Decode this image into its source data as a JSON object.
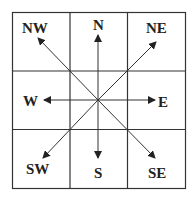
{
  "diagram": {
    "grid": {
      "rows": 3,
      "cols": 3
    },
    "center": "",
    "directions": [
      {
        "id": "nw",
        "label": "NW"
      },
      {
        "id": "n",
        "label": "N"
      },
      {
        "id": "ne",
        "label": "NE"
      },
      {
        "id": "w",
        "label": "W"
      },
      {
        "id": "e",
        "label": "E"
      },
      {
        "id": "sw",
        "label": "SW"
      },
      {
        "id": "s",
        "label": "S"
      },
      {
        "id": "se",
        "label": "SE"
      }
    ],
    "colors": {
      "line": "#333333",
      "text": "#222222",
      "background": "#ffffff"
    }
  }
}
